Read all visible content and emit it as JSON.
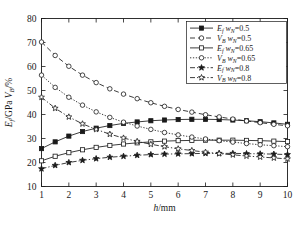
{
  "chart_data": {
    "type": "line",
    "title": "",
    "xlabel": "h/mm",
    "ylabel": "E_f/GPa  V_B/%",
    "ylabel_parts": {
      "e": "E",
      "e_sub": "f",
      "unit1": "/GPa",
      "v": "V",
      "v_sub": "B",
      "unit2": "/%"
    },
    "xlim": [
      1,
      10
    ],
    "ylim": [
      10,
      80
    ],
    "xticks": [
      1,
      2,
      3,
      4,
      5,
      6,
      7,
      8,
      9,
      10
    ],
    "xticklabels": [
      "1",
      "2",
      "3",
      "4",
      "5",
      "6",
      "7",
      "8",
      "9",
      "10"
    ],
    "yticks": [
      10,
      20,
      30,
      40,
      50,
      60,
      70,
      80
    ],
    "yticklabels": [
      "10",
      "20",
      "30",
      "40",
      "50",
      "60",
      "70",
      "80"
    ],
    "grid": false,
    "legend_position": "upper right",
    "x": [
      1,
      1.5,
      2,
      2.5,
      3,
      3.5,
      4,
      4.5,
      5,
      5.5,
      6,
      6.5,
      7,
      7.5,
      8,
      8.5,
      9,
      9.5,
      10
    ],
    "series": [
      {
        "name": "Ef wN=0.5",
        "label_main": "E",
        "label_sub": "f",
        "label_var": "w",
        "label_var_sub": "N",
        "label_value": "=0.5",
        "marker": "filled-square",
        "linestyle": "solid",
        "values": [
          25.8,
          28.6,
          31.0,
          32.9,
          34.3,
          35.4,
          36.3,
          36.9,
          37.4,
          37.7,
          37.9,
          38.0,
          38.0,
          37.9,
          37.7,
          37.4,
          37.0,
          36.5,
          35.9
        ]
      },
      {
        "name": "VB wN=0.5",
        "label_main": "V",
        "label_sub": "B",
        "label_var": "w",
        "label_var_sub": "N",
        "label_value": "=0.5",
        "marker": "open-circle",
        "linestyle": "dashed",
        "values": [
          70.2,
          64.6,
          60.1,
          56.4,
          53.3,
          50.7,
          48.5,
          46.6,
          44.9,
          43.4,
          42.1,
          41.0,
          39.9,
          39.0,
          38.1,
          37.3,
          36.6,
          35.9,
          35.3
        ]
      },
      {
        "name": "Ef wN=0.65",
        "label_main": "E",
        "label_sub": "f",
        "label_var": "w",
        "label_var_sub": "N",
        "label_value": "=0.65",
        "marker": "open-square",
        "linestyle": "solid",
        "values": [
          20.7,
          22.6,
          24.1,
          25.3,
          26.3,
          27.1,
          27.7,
          28.2,
          28.6,
          28.9,
          29.1,
          29.2,
          29.3,
          29.3,
          29.3,
          29.2,
          29.1,
          28.9,
          28.7
        ]
      },
      {
        "name": "VB wN=0.65",
        "label_main": "V",
        "label_sub": "B",
        "label_var": "w",
        "label_var_sub": "N",
        "label_value": "=0.65",
        "marker": "open-circle",
        "linestyle": "dotted",
        "values": [
          56.4,
          51.3,
          47.2,
          43.9,
          41.1,
          38.8,
          36.8,
          35.2,
          33.8,
          32.5,
          31.5,
          30.6,
          29.8,
          29.1,
          28.5,
          27.9,
          27.4,
          27.0,
          26.6
        ]
      },
      {
        "name": "Ef wN=0.8",
        "label_main": "E",
        "label_sub": "f",
        "label_var": "w",
        "label_var_sub": "N",
        "label_value": "=0.8",
        "marker": "filled-star",
        "linestyle": "dashdot",
        "values": [
          17.4,
          18.8,
          20.0,
          20.9,
          21.6,
          22.2,
          22.6,
          23.0,
          23.3,
          23.5,
          23.6,
          23.7,
          23.8,
          23.8,
          23.8,
          23.7,
          23.6,
          23.5,
          23.3
        ]
      },
      {
        "name": "VB wN=0.8",
        "label_main": "V",
        "label_sub": "B",
        "label_var": "w",
        "label_var_sub": "N",
        "label_value": "=0.8",
        "marker": "open-star",
        "linestyle": "dashdot",
        "values": [
          47.2,
          42.6,
          39.0,
          36.1,
          33.8,
          31.8,
          30.2,
          28.8,
          27.6,
          26.6,
          25.7,
          25.0,
          24.3,
          23.7,
          23.2,
          22.7,
          22.3,
          21.9,
          21.5
        ]
      }
    ]
  }
}
